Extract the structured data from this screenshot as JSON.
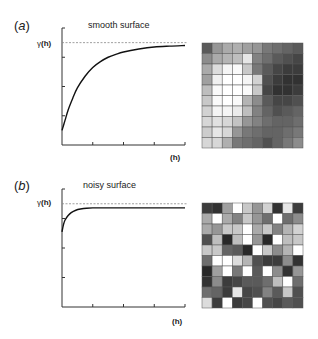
{
  "chart_data": [
    {
      "type": "line",
      "panel": "(a)",
      "panel_letter": "a",
      "title": "smooth surface",
      "ylabel_symbol": "γ",
      "ylabel_arg": "(h)",
      "xlabel": "(h)",
      "xlim": [
        0,
        4
      ],
      "ylim": [
        0,
        4
      ],
      "x_ticks": [
        0,
        1,
        2,
        3,
        4
      ],
      "y_ticks": [
        0,
        1,
        2,
        3,
        4
      ],
      "sill": 3.5,
      "series": [
        {
          "name": "variogram",
          "x": [
            0,
            0.1,
            0.2,
            0.35,
            0.5,
            0.75,
            1.0,
            1.25,
            1.5,
            1.75,
            2.0,
            2.5,
            3.0,
            3.5,
            4.0
          ],
          "y": [
            0.5,
            0.85,
            1.2,
            1.6,
            1.95,
            2.35,
            2.65,
            2.85,
            3.0,
            3.1,
            3.18,
            3.28,
            3.35,
            3.38,
            3.4
          ]
        }
      ],
      "grid_image": {
        "rows": 10,
        "cols": 10,
        "gray_levels": [
          [
            90,
            150,
            170,
            175,
            160,
            150,
            120,
            110,
            100,
            90
          ],
          [
            140,
            170,
            180,
            190,
            230,
            130,
            110,
            90,
            80,
            70
          ],
          [
            170,
            220,
            245,
            250,
            200,
            120,
            90,
            70,
            60,
            60
          ],
          [
            160,
            240,
            255,
            255,
            245,
            210,
            80,
            60,
            50,
            50
          ],
          [
            190,
            250,
            255,
            255,
            250,
            200,
            70,
            50,
            50,
            60
          ],
          [
            200,
            250,
            255,
            250,
            180,
            140,
            90,
            70,
            70,
            80
          ],
          [
            210,
            245,
            245,
            235,
            190,
            130,
            100,
            80,
            90,
            100
          ],
          [
            215,
            225,
            215,
            195,
            150,
            130,
            110,
            100,
            100,
            110
          ],
          [
            205,
            230,
            215,
            150,
            120,
            110,
            100,
            100,
            110,
            120
          ],
          [
            215,
            215,
            175,
            120,
            110,
            100,
            80,
            100,
            120,
            140
          ]
        ]
      }
    },
    {
      "type": "line",
      "panel": "(b)",
      "panel_letter": "b",
      "title": "noisy surface",
      "ylabel_symbol": "γ",
      "ylabel_arg": "(h)",
      "xlabel": "(h)",
      "xlim": [
        0,
        4
      ],
      "ylim": [
        0,
        4
      ],
      "x_ticks": [
        0,
        1,
        2,
        3,
        4
      ],
      "y_ticks": [
        0,
        1,
        2,
        3,
        4
      ],
      "sill": 3.5,
      "series": [
        {
          "name": "variogram",
          "x": [
            0,
            0.05,
            0.1,
            0.2,
            0.3,
            0.45,
            0.6,
            0.8,
            1.0,
            1.5,
            2.0,
            3.0,
            4.0
          ],
          "y": [
            2.55,
            2.8,
            2.95,
            3.1,
            3.2,
            3.28,
            3.32,
            3.35,
            3.36,
            3.36,
            3.36,
            3.36,
            3.36
          ]
        }
      ],
      "grid_image": {
        "rows": 10,
        "cols": 10,
        "gray_levels": [
          [
            60,
            50,
            160,
            255,
            200,
            150,
            210,
            50,
            230,
            60
          ],
          [
            170,
            255,
            170,
            130,
            200,
            150,
            110,
            255,
            110,
            140
          ],
          [
            170,
            150,
            200,
            200,
            255,
            170,
            200,
            130,
            180,
            210
          ],
          [
            80,
            190,
            40,
            190,
            255,
            150,
            40,
            255,
            190,
            200
          ],
          [
            200,
            200,
            100,
            90,
            40,
            255,
            200,
            140,
            180,
            255
          ],
          [
            110,
            255,
            255,
            220,
            180,
            80,
            60,
            60,
            140,
            50
          ],
          [
            40,
            160,
            255,
            120,
            255,
            90,
            255,
            140,
            50,
            150
          ],
          [
            50,
            140,
            60,
            70,
            90,
            90,
            110,
            190,
            255,
            110
          ],
          [
            110,
            100,
            60,
            230,
            70,
            80,
            130,
            90,
            200,
            80
          ],
          [
            220,
            60,
            255,
            60,
            70,
            255,
            80,
            70,
            90,
            80
          ]
        ]
      }
    }
  ],
  "colors": {
    "axis": "#333333",
    "curve": "#111111",
    "sill": "#888888",
    "grid_line": "#555555"
  }
}
